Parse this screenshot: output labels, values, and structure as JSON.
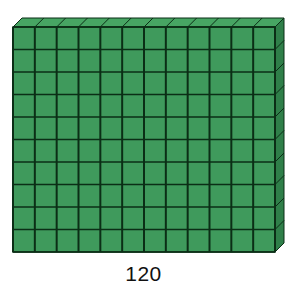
{
  "figure": {
    "type": "base-ten block (flat of unit cubes)",
    "columns": 12,
    "rows": 10,
    "colors": {
      "face": "#3f9a5c",
      "top": "#47a563",
      "side": "#2f7f49",
      "grid_line": "#0b2e16"
    }
  },
  "caption": {
    "value": "120"
  }
}
